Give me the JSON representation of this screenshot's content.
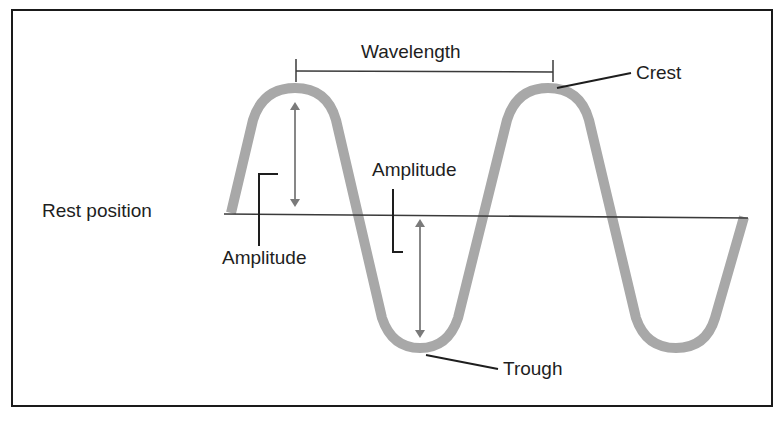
{
  "diagram": {
    "labels": {
      "wavelength": "Wavelength",
      "crest": "Crest",
      "trough": "Trough",
      "rest_position": "Rest position",
      "amplitude_upper": "Amplitude",
      "amplitude_lower": "Amplitude"
    },
    "colors": {
      "wave": "#a8a8a8",
      "lines": "#1e1e1e",
      "arrows": "#7a7a7a",
      "frame": "#1a1a1a",
      "background": "#ffffff"
    },
    "elements": [
      "wave-curve",
      "rest-position-line",
      "wavelength-bar",
      "crest-leader",
      "trough-leader",
      "amplitude-arrow-crest",
      "amplitude-arrow-trough",
      "amplitude-bracket-left",
      "amplitude-bracket-right"
    ]
  }
}
